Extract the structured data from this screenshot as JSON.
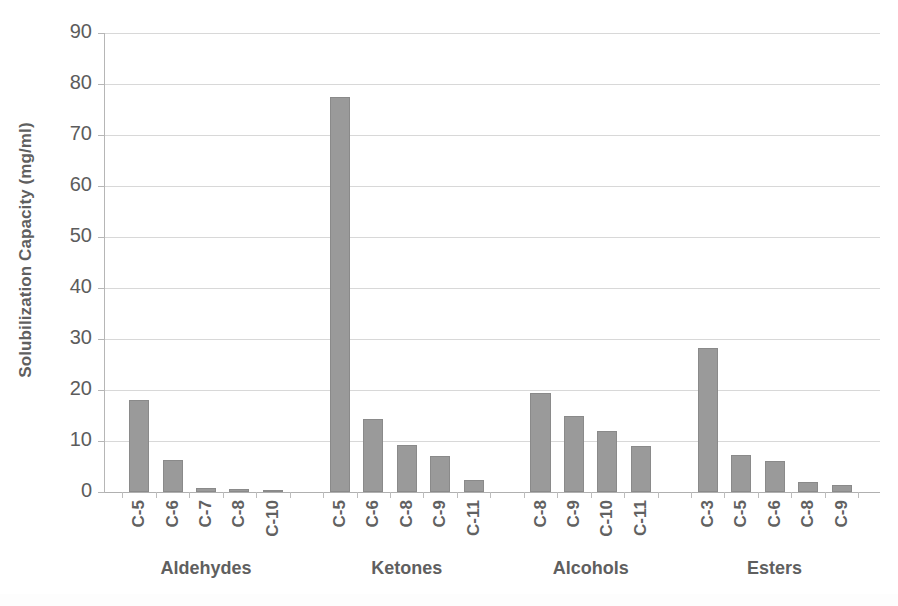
{
  "chart_data": {
    "type": "bar",
    "title": "",
    "xlabel": "",
    "ylabel": "Solubilization Capacity (mg/ml)",
    "ylim": [
      0,
      90
    ],
    "ytick_step": 10,
    "yticks": [
      90,
      80,
      70,
      60,
      50,
      40,
      30,
      20,
      10,
      0
    ],
    "grid": true,
    "legend": "none",
    "bar_color": "#9a9a9a",
    "bar_edge_color": "#8a8a8a",
    "grid_color": "#d8d8d8",
    "axis_color": "#b6b6b6",
    "groups": [
      {
        "name": "Aldehydes",
        "categories": [
          "C-5",
          "C-6",
          "C-7",
          "C-8",
          "C-10"
        ],
        "values": [
          18.0,
          6.3,
          0.8,
          0.5,
          0.2
        ]
      },
      {
        "name": "Ketones",
        "categories": [
          "C-5",
          "C-6",
          "C-8",
          "C-9",
          "C-11"
        ],
        "values": [
          77.5,
          14.3,
          9.2,
          7.0,
          2.3
        ]
      },
      {
        "name": "Alcohols",
        "categories": [
          "C-8",
          "C-9",
          "C-10",
          "C-11"
        ],
        "values": [
          19.5,
          15.0,
          12.0,
          9.0
        ]
      },
      {
        "name": "Esters",
        "categories": [
          "C-3",
          "C-5",
          "C-6",
          "C-8",
          "C-9"
        ],
        "values": [
          28.2,
          7.3,
          6.0,
          2.0,
          1.4
        ]
      }
    ],
    "categories": [
      "C-5",
      "C-6",
      "C-7",
      "C-8",
      "C-10",
      "C-5",
      "C-6",
      "C-8",
      "C-9",
      "C-11",
      "C-8",
      "C-9",
      "C-10",
      "C-11",
      "C-3",
      "C-5",
      "C-6",
      "C-8",
      "C-9"
    ],
    "values": [
      18.0,
      6.3,
      0.8,
      0.5,
      0.2,
      77.5,
      14.3,
      9.2,
      7.0,
      2.3,
      19.5,
      15.0,
      12.0,
      9.0,
      28.2,
      7.3,
      6.0,
      2.0,
      1.4
    ]
  }
}
